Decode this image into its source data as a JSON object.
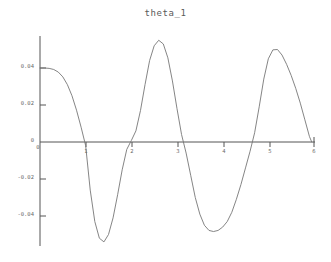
{
  "figure": {
    "title": "theta_1",
    "background_color": "#ffffff",
    "axis_color": "#555555",
    "curve_color": "#777777",
    "label_color": "#6b6b6b"
  },
  "chart_data": {
    "type": "line",
    "title": "theta_1",
    "xlabel": "",
    "ylabel": "",
    "xlim": [
      0,
      6.0
    ],
    "ylim": [
      -0.058,
      0.058
    ],
    "grid": false,
    "legend": null,
    "axis_style": "crossing-axes-at-origin",
    "xticks": [
      0,
      1,
      2,
      3,
      4,
      5,
      6
    ],
    "xtick_labels": [
      "0",
      "1",
      "2",
      "3",
      "4",
      "5",
      "6"
    ],
    "xtick_labels_shown": [
      "1",
      "2",
      "3",
      "4",
      "5"
    ],
    "yticks": [
      -0.04,
      -0.02,
      0,
      0.02,
      0.04
    ],
    "ytick_labels": [
      "-0.04",
      "-0.02",
      "0",
      "0.02",
      "0.04"
    ],
    "series": [
      {
        "name": "theta_1",
        "x": [
          0.0,
          0.1,
          0.2,
          0.3,
          0.4,
          0.5,
          0.6,
          0.7,
          0.8,
          0.9,
          1.0,
          1.1,
          1.2,
          1.3,
          1.4,
          1.5,
          1.6,
          1.7,
          1.8,
          1.9,
          2.0,
          2.1,
          2.2,
          2.3,
          2.4,
          2.5,
          2.6,
          2.7,
          2.8,
          2.9,
          3.0,
          3.1,
          3.2,
          3.3,
          3.4,
          3.5,
          3.6,
          3.7,
          3.8,
          3.9,
          4.0,
          4.1,
          4.2,
          4.3,
          4.4,
          4.5,
          4.6,
          4.7,
          4.8,
          4.9,
          5.0,
          5.1,
          5.2,
          5.3,
          5.4,
          5.5,
          5.6,
          5.7,
          5.8,
          5.9,
          5.95
        ],
        "y": [
          0.04,
          0.04,
          0.0398,
          0.0392,
          0.0378,
          0.0352,
          0.031,
          0.025,
          0.0172,
          0.008,
          -0.002,
          -0.026,
          -0.043,
          -0.052,
          -0.054,
          -0.05,
          -0.041,
          -0.0285,
          -0.015,
          -0.004,
          0.0008,
          0.006,
          0.017,
          0.031,
          0.044,
          0.052,
          0.055,
          0.053,
          0.0455,
          0.033,
          0.018,
          0.004,
          -0.006,
          -0.018,
          -0.03,
          -0.039,
          -0.045,
          -0.0478,
          -0.0484,
          -0.0478,
          -0.046,
          -0.043,
          -0.038,
          -0.031,
          -0.023,
          -0.014,
          -0.005,
          0.005,
          0.019,
          0.034,
          0.045,
          0.0498,
          0.05,
          0.047,
          0.042,
          0.036,
          0.029,
          0.021,
          0.012,
          0.003,
          0.0
        ]
      }
    ],
    "annotations": {
      "initial_value": 0.04,
      "max_value": 0.055,
      "min_value": -0.054,
      "final_value": 0.0
    }
  },
  "ticks": {
    "y": [
      {
        "label": "0.04",
        "value": 0.04
      },
      {
        "label": "0.02",
        "value": 0.02
      },
      {
        "label": "0",
        "value": 0
      },
      {
        "label": "-0.02",
        "value": -0.02
      },
      {
        "label": "-0.04",
        "value": -0.04
      }
    ],
    "x": [
      {
        "label": "0",
        "value": 0
      },
      {
        "label": "1",
        "value": 1
      },
      {
        "label": "2",
        "value": 2
      },
      {
        "label": "3",
        "value": 3
      },
      {
        "label": "4",
        "value": 4
      },
      {
        "label": "5",
        "value": 5
      },
      {
        "label": "6",
        "value": 6
      }
    ]
  }
}
